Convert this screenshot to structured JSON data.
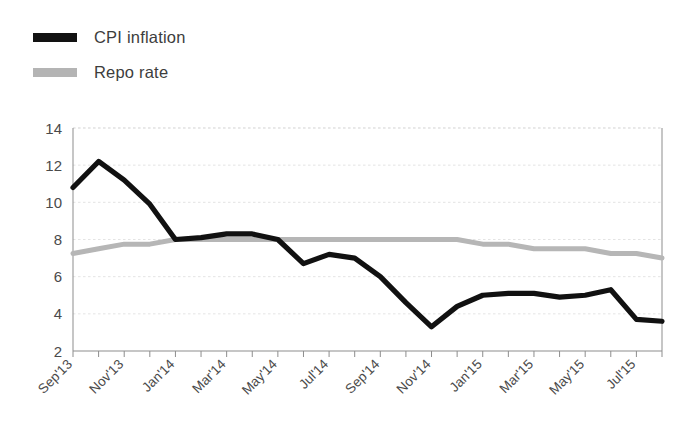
{
  "chart_data": {
    "type": "line",
    "title": "",
    "subtitle": "",
    "xlabel": "",
    "ylabel": "",
    "ylim": [
      2,
      14
    ],
    "ytick_step": 2,
    "yticks": [
      "14",
      "12",
      "10",
      "8",
      "6",
      "4",
      "2"
    ],
    "grid": true,
    "legend_position": "top-left",
    "x": [
      "Sep'13",
      "Oct'13",
      "Nov'13",
      "Dec'13",
      "Jan'14",
      "Feb'14",
      "Mar'14",
      "Apr'14",
      "May'14",
      "Jun'14",
      "Jul'14",
      "Aug'14",
      "Sep'14",
      "Oct'14",
      "Nov'14",
      "Dec'14",
      "Jan'15",
      "Feb'15",
      "Mar'15",
      "Apr'15",
      "May'15",
      "Jun'15",
      "Jul'15",
      "Aug'15"
    ],
    "xtick_labels": [
      "Sep'13",
      "Nov'13",
      "Jan'14",
      "Mar'14",
      "May'14",
      "Jul'14",
      "Sep'14",
      "Nov'14",
      "Jan'15",
      "Mar'15",
      "May'15",
      "Jul'15"
    ],
    "series": [
      {
        "name": "CPI inflation",
        "color": "#111111",
        "values": [
          10.8,
          12.2,
          11.2,
          9.9,
          8.0,
          8.1,
          8.3,
          8.3,
          8.0,
          6.7,
          7.2,
          7.0,
          6.0,
          4.6,
          3.3,
          4.4,
          5.0,
          5.1,
          5.1,
          4.9,
          5.0,
          5.3,
          3.7,
          3.6
        ]
      },
      {
        "name": "Repo rate",
        "color": "#b6b6b6",
        "values": [
          7.25,
          7.5,
          7.75,
          7.75,
          8.0,
          8.0,
          8.0,
          8.0,
          8.0,
          8.0,
          8.0,
          8.0,
          8.0,
          8.0,
          8.0,
          8.0,
          7.75,
          7.75,
          7.5,
          7.5,
          7.5,
          7.25,
          7.25,
          7.0
        ]
      }
    ]
  },
  "legend": {
    "items": [
      {
        "label": "CPI inflation",
        "swatch": "cpi"
      },
      {
        "label": "Repo rate",
        "swatch": "repo"
      }
    ]
  }
}
